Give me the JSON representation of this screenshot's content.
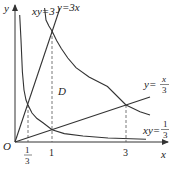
{
  "diagram": {
    "axes": {
      "x_label": "x",
      "y_label": "y",
      "origin_label": "O"
    },
    "x_ticks": [
      {
        "label_num": "1",
        "label_den": "3",
        "value": 0.3333
      },
      {
        "label": "1",
        "value": 1
      },
      {
        "label": "3",
        "value": 3
      }
    ],
    "curves": [
      {
        "name": "xy=3",
        "label": "xy=3"
      },
      {
        "name": "y=3x",
        "label": "y=3x"
      },
      {
        "name": "y=x/3",
        "label_prefix": "y=",
        "label_num": "x",
        "label_den": "3"
      },
      {
        "name": "xy=1/3",
        "label_prefix": "xy=",
        "label_num": "1",
        "label_den": "3"
      }
    ],
    "region_label": "D",
    "colors": {
      "stroke": "#333333",
      "dashed": "#555555"
    }
  }
}
